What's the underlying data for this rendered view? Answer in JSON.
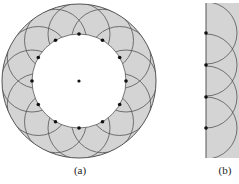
{
  "figure": {
    "panels": [
      {
        "id": "a",
        "label": "(a)",
        "description": "Annular region with 12 source points on inner circle and overlapping wavelet arcs",
        "center": [
          79,
          81
        ],
        "outer_radius": 77,
        "inner_radius": 47,
        "point_count": 12,
        "arc_radius": 31
      },
      {
        "id": "b",
        "label": "(b)",
        "description": "Plane wavefront with 4 source points and overlapping wavelet arcs",
        "line_x": 206,
        "top": 3,
        "bottom": 158,
        "points_y": [
          33,
          65,
          97,
          128
        ],
        "arc_radius": 31
      }
    ],
    "colors": {
      "fill": "#d4d4d4",
      "line": "#555555",
      "dot": "#111111"
    }
  }
}
